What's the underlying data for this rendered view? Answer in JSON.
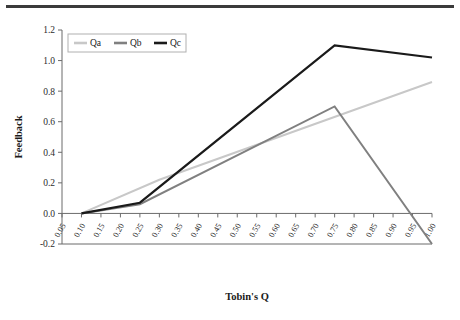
{
  "chart_data": {
    "type": "line",
    "title": "",
    "xlabel": "Tobin's Q",
    "ylabel": "Feedback",
    "xlim": [
      0.05,
      1.0
    ],
    "ylim": [
      -0.2,
      1.2
    ],
    "grid": false,
    "legend_position": "top-left",
    "x": [
      0.05,
      0.1,
      0.15,
      0.2,
      0.25,
      0.3,
      0.35,
      0.4,
      0.45,
      0.5,
      0.55,
      0.6,
      0.65,
      0.7,
      0.75,
      0.8,
      0.85,
      0.9,
      0.95,
      1.0
    ],
    "categories": [
      "0.05",
      "0.10",
      "0.15",
      "0.20",
      "0.25",
      "0.30",
      "0.35",
      "0.40",
      "0.45",
      "0.50",
      "0.55",
      "0.60",
      "0.65",
      "0.70",
      "0.75",
      "0.80",
      "0.85",
      "0.90",
      "0.95",
      "1.00"
    ],
    "ytick_labels": [
      "1.2",
      "1.0",
      "0.8",
      "0.6",
      "0.4",
      "0.2",
      "0.0",
      "-0.2"
    ],
    "ytick_values": [
      1.2,
      1.0,
      0.8,
      0.6,
      0.4,
      0.2,
      0.0,
      -0.2
    ],
    "series": [
      {
        "name": "Qa",
        "color": "#c8c8c8",
        "width": 2.0,
        "nodes_x": [
          0.1,
          0.3,
          1.0
        ],
        "nodes_y": [
          0.0,
          0.22,
          0.86
        ]
      },
      {
        "name": "Qb",
        "color": "#808080",
        "width": 2.0,
        "nodes_x": [
          0.1,
          0.25,
          0.75,
          1.0
        ],
        "nodes_y": [
          0.0,
          0.06,
          0.7,
          -0.2
        ]
      },
      {
        "name": "Qc",
        "color": "#1a1a1a",
        "width": 2.2,
        "nodes_x": [
          0.1,
          0.25,
          0.75,
          1.0
        ],
        "nodes_y": [
          0.0,
          0.07,
          1.1,
          1.02
        ]
      }
    ]
  },
  "legend": {
    "entries": [
      "Qa",
      "Qb",
      "Qc"
    ]
  }
}
